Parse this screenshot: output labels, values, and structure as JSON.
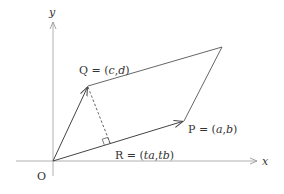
{
  "diagram": {
    "axes": {
      "x_label": "x",
      "y_label": "y",
      "origin_label": "O",
      "color": "#b0b0b0"
    },
    "points": {
      "O": {
        "label": "O",
        "px": [
          53,
          161
        ]
      },
      "P": {
        "label": "P = (a,b)",
        "name": "P",
        "coords": "(a,b)",
        "px": [
          184,
          121
        ]
      },
      "Q": {
        "label": "Q = (c,d)",
        "name": "Q",
        "coords": "(c,d)",
        "px": [
          88,
          86
        ]
      },
      "S": {
        "px": [
          222,
          47
        ]
      },
      "R": {
        "label": "R = (ta,tb)",
        "name": "R",
        "coords": "(ta,tb)",
        "px": [
          110,
          143
        ]
      }
    },
    "labels": {
      "Q": "Q = (c,d)",
      "P": "P = (a,b)",
      "R": "R = (ta,tb)",
      "O": "O",
      "x": "x",
      "y": "y"
    },
    "line_color": "#444444",
    "dashed_segment": "Q to R (perpendicular)",
    "right_angle_marker_at": "R"
  }
}
